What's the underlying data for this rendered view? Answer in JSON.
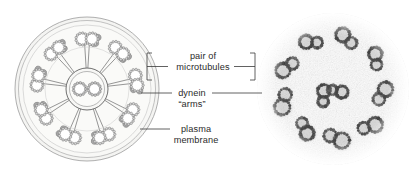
{
  "figure": {
    "background_color": "#ffffff",
    "width": 412,
    "height": 179,
    "panels": [
      {
        "name": "schematic-diagram",
        "side": "left"
      },
      {
        "name": "electron-micrograph",
        "side": "right"
      }
    ]
  },
  "labels": {
    "microtubules": {
      "line1": "pair of",
      "line2": "microtubules"
    },
    "dynein": {
      "line1": "dynein",
      "line2": "“arms”"
    },
    "membrane": {
      "line1": "plasma",
      "line2": "membrane"
    }
  },
  "colors": {
    "text": "#2b2b2b",
    "leader_line": "#3a3a3a",
    "membrane_fill": "#f2f2f0",
    "membrane_stroke": "#9a9a9a",
    "matrix_fill": "#f7f7f5",
    "doublet_stroke": "#6d6d6d",
    "doublet_fill": "#ffffff",
    "subunit_fill": "#d6d6d6",
    "dynein_fill": "#a8a8a8",
    "spoke_stroke": "#8a8a8a",
    "sheath_stroke": "#707070",
    "micrograph_dark": "#3c3c3c",
    "micrograph_light": "#efefef"
  },
  "schematic": {
    "outer_doublet_count": 9,
    "central_pair_count": 2,
    "radial_spoke_count": 9
  },
  "micrograph": {
    "description": "axoneme cross-section electron micrograph",
    "outer_doublet_count": 9,
    "central_pair_count": 2
  }
}
